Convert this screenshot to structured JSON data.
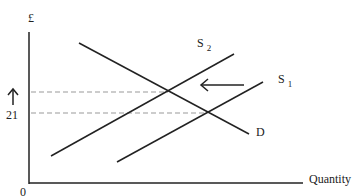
{
  "diagram": {
    "y_axis_label": "£",
    "x_axis_label": "Quantity",
    "origin_label": "0",
    "price_tick_label": "21",
    "curves": [
      {
        "name": "S",
        "subscript": "2"
      },
      {
        "name": "S",
        "subscript": "1"
      },
      {
        "name": "D",
        "subscript": ""
      }
    ],
    "shift_arrow": "leftward shift from S1 to S2",
    "price_increase_arrow": "↑"
  }
}
